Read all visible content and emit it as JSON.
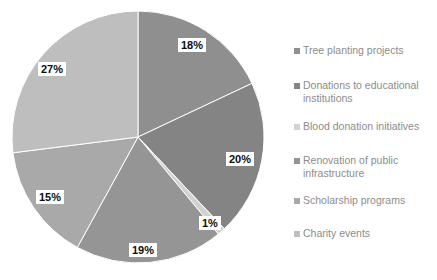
{
  "chart_data": {
    "type": "pie",
    "title": "",
    "subtitle": "",
    "xlabel": "",
    "ylabel": "",
    "grid": false,
    "legend_position": "right",
    "start_angle_deg": 0,
    "direction": "clockwise",
    "categories": [
      "Tree planting projects",
      "Donations to educational institutions",
      "Blood donation initiatives",
      "Renovation of public infrastructure",
      "Scholarship programs",
      "Charity events"
    ],
    "values": [
      18,
      20,
      1,
      19,
      15,
      27
    ],
    "value_labels": [
      "18%",
      "20%",
      "1%",
      "19%",
      "15%",
      "27%"
    ],
    "colors": [
      "#8f8f8f",
      "#848484",
      "#d2d2d2",
      "#959595",
      "#a9a9a9",
      "#bebebe"
    ],
    "units": "percent",
    "total": 100
  },
  "pie": {
    "center_x": 138,
    "center_y": 137,
    "radius": 126,
    "slices": [
      {
        "name": "tree-planting-projects",
        "label": "18%",
        "value": 18,
        "color": "#8f8f8f",
        "label_x": 178,
        "label_y": 38
      },
      {
        "name": "donations-education",
        "label": "20%",
        "value": 20,
        "color": "#848484",
        "label_x": 226,
        "label_y": 152
      },
      {
        "name": "blood-donation-initiatives",
        "label": "1%",
        "value": 1,
        "color": "#d2d2d2",
        "label_x": 199,
        "label_y": 216
      },
      {
        "name": "renovation-public-infra",
        "label": "19%",
        "value": 19,
        "color": "#959595",
        "label_x": 129,
        "label_y": 243
      },
      {
        "name": "scholarship-programs",
        "label": "15%",
        "value": 15,
        "color": "#a9a9a9",
        "label_x": 36,
        "label_y": 190
      },
      {
        "name": "charity-events",
        "label": "27%",
        "value": 27,
        "color": "#bebebe",
        "label_x": 38,
        "label_y": 62
      }
    ]
  },
  "legend": {
    "items": [
      {
        "label": "Tree planting projects",
        "color": "#8f8f8f",
        "top": 8
      },
      {
        "label": "Donations to educational institutions",
        "color": "#848484",
        "top": 43
      },
      {
        "label": "Blood donation initiatives",
        "color": "#d2d2d2",
        "top": 84
      },
      {
        "label": "Renovation of public infrastructure",
        "color": "#959595",
        "top": 118
      },
      {
        "label": "Scholarship programs",
        "color": "#a9a9a9",
        "top": 158
      },
      {
        "label": "Charity events",
        "color": "#bebebe",
        "top": 191
      }
    ]
  }
}
